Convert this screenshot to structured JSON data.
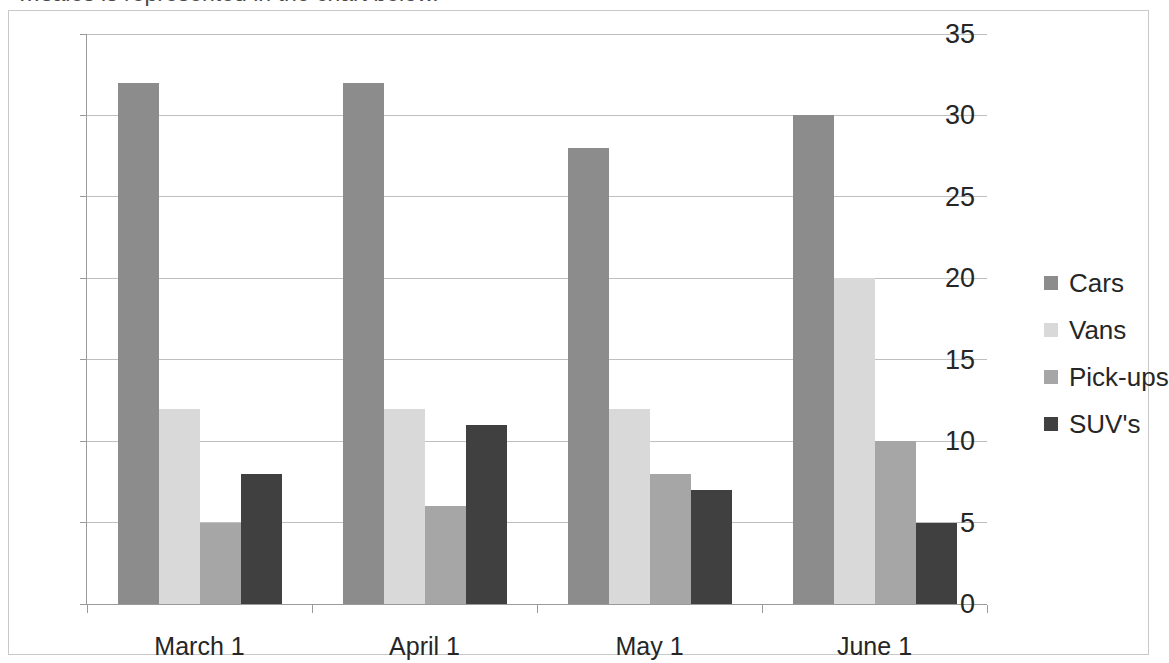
{
  "page": {
    "clipped_heading_text": "…sales is represented in the chart below."
  },
  "chart_data": {
    "type": "bar",
    "title": "",
    "subtitle": "",
    "xlabel": "",
    "ylabel": "",
    "categories": [
      "March 1",
      "April 1",
      "May 1",
      "June 1"
    ],
    "series": [
      {
        "name": "Cars",
        "color": "#8c8c8c",
        "values": [
          32,
          32,
          28,
          30
        ]
      },
      {
        "name": "Vans",
        "color": "#d9d9d9",
        "values": [
          12,
          12,
          12,
          20
        ]
      },
      {
        "name": "Pick-ups",
        "color": "#a6a6a6",
        "values": [
          5,
          6,
          8,
          10
        ]
      },
      {
        "name": "SUV's",
        "color": "#404040",
        "values": [
          8,
          11,
          7,
          5
        ]
      }
    ],
    "ylim": [
      0,
      35
    ],
    "yticks": [
      0,
      5,
      10,
      15,
      20,
      25,
      30,
      35
    ],
    "ytick_labels": [
      "0",
      "5",
      "10",
      "15",
      "20",
      "25",
      "30",
      "35"
    ],
    "grid": true,
    "grid_axis": "y",
    "legend": true,
    "legend_position": "right",
    "legend_entries": [
      "Cars",
      "Vans",
      "Pick-ups",
      "SUV's"
    ],
    "bar_mode": "grouped",
    "plot_background": "#ffffff",
    "gridline_color": "#bfbfbf",
    "axis_color": "#9a9a9a"
  }
}
